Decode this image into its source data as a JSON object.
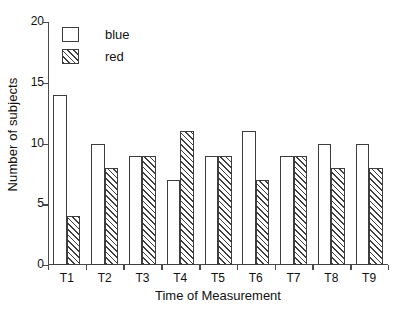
{
  "chart_data": {
    "type": "bar",
    "title": "",
    "subtitle": "",
    "xlabel": "Time of Measurement",
    "ylabel": "Number of subjects",
    "categories": [
      "T1",
      "T2",
      "T3",
      "T4",
      "T5",
      "T6",
      "T7",
      "T8",
      "T9"
    ],
    "series": [
      {
        "name": "blue",
        "values": [
          14,
          10,
          9,
          7,
          9,
          11,
          9,
          10,
          10
        ],
        "fill": "white",
        "pattern": "solid",
        "edge_color": "#3d3d3d"
      },
      {
        "name": "red",
        "values": [
          4,
          8,
          9,
          11,
          9,
          7,
          9,
          8,
          8
        ],
        "fill": "white",
        "pattern": "forward-diagonal-hatch",
        "edge_color": "#3d3d3d"
      }
    ],
    "ylim": [
      0,
      20
    ],
    "ytick_labels": [
      "0",
      "5",
      "10",
      "15",
      "20"
    ],
    "ytick_values": [
      0,
      5,
      10,
      15,
      20
    ],
    "grid": false,
    "legend_position": "top-left",
    "spines": [
      "left",
      "bottom"
    ]
  },
  "legend": {
    "entries": [
      {
        "label": "blue",
        "swatch": "legend-swatch-blue"
      },
      {
        "label": "red",
        "swatch": "legend-swatch-red"
      }
    ]
  }
}
